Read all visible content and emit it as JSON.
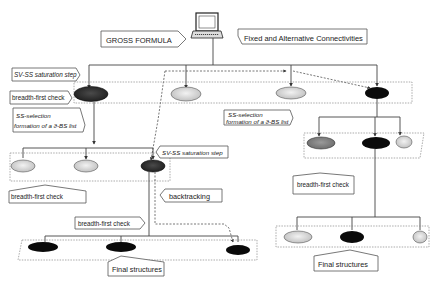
{
  "labels": {
    "gross_formula": "GROSS FORMULA",
    "fixed_alt": "Fixed and Alternative Connectivities",
    "sv_ss_1": "SV-SS saturation step",
    "bfc_1": "breadth-first check",
    "ss_sel_1a": "SS-selection",
    "ss_sel_1b": "formation of a ϑ-BS list",
    "ss_sel_2a": "SS-selection",
    "ss_sel_2b": "formation of a ϑ-BS list",
    "sv_ss_2": "SV-SS saturation step",
    "bfc_2": "breadth-first check",
    "backtracking": "backtracking",
    "bfc_3": "breadth-first check",
    "bfc_4": "breadth-first check",
    "final_1": "Final structures",
    "final_2": "Final structures"
  },
  "icons": {
    "computer": "computer-icon"
  },
  "colors": {
    "black_node": "#0a0a0a",
    "dark_node": "#3a3a3a",
    "mid_node": "#7a7a7a",
    "light_node": "#c8c8c8",
    "lighter_node": "#dedede"
  }
}
